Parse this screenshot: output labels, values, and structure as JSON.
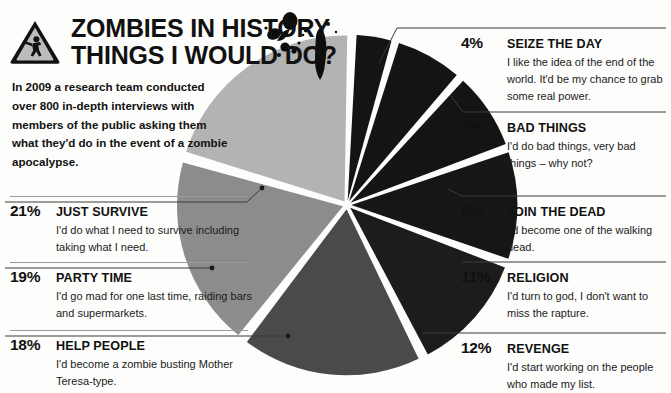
{
  "header": {
    "icon": "zombie-warning-triangle-icon",
    "title_line1": "ZOMBIES IN HISTORY",
    "title_line2": "THINGS I WOULD DO?",
    "splatter_icon": "ink-splatter-decoration"
  },
  "intro": {
    "text": "In 2009 a research team conducted over 800 in-depth interviews with members of the public asking them what they'd do in the event of a zombie apocalypse."
  },
  "colors": {
    "slice_seize_the_day": "#141414",
    "slice_bad_things": "#141414",
    "slice_join_the_dead": "#141414",
    "slice_religion": "#161616",
    "slice_revenge": "#1c1c1c",
    "slice_help_people": "#4a4a4a",
    "slice_party_time": "#8c8c8c",
    "slice_just_survive": "#b3b3b3",
    "background": "#fdfdfb",
    "rule": "#9a9a9a",
    "text": "#111111"
  },
  "chart_data": {
    "type": "pie",
    "categories": [
      "SEIZE THE DAY",
      "BAD THINGS",
      "JOIN THE DEAD",
      "RELIGION",
      "REVENGE",
      "HELP PEOPLE",
      "PARTY TIME",
      "JUST SURVIVE"
    ],
    "values": [
      4,
      7,
      8,
      11,
      12,
      18,
      19,
      21
    ],
    "value_labels": [
      "4%",
      "7%",
      "8%",
      "11%",
      "12%",
      "18%",
      "19%",
      "21%"
    ],
    "unit": "%",
    "exploded": true,
    "legend_position": "both-sides",
    "grid": false
  },
  "left_labels": [
    {
      "pct": "21%",
      "title": "JUST SURVIVE",
      "desc": "I'd do what I need to survive including taking what I need."
    },
    {
      "pct": "19%",
      "title": "PARTY TIME",
      "desc": "I'd go mad for one last time, raiding bars and supermarkets."
    },
    {
      "pct": "18%",
      "title": "HELP PEOPLE",
      "desc": "I'd become a zombie busting Mother Teresa-type."
    }
  ],
  "right_labels": [
    {
      "pct": "4%",
      "title": "SEIZE THE DAY",
      "desc": "I like the idea of the end of the world. It'd be my chance to grab some real power."
    },
    {
      "pct": "7%",
      "title": "BAD THINGS",
      "desc": "I'd do bad things, very bad things – why not?"
    },
    {
      "pct": "8%",
      "title": "JOIN THE DEAD",
      "desc": "I'd become one of the walking dead."
    },
    {
      "pct": "11%",
      "title": "RELIGION",
      "desc": "I'd turn to god, I don't want to miss the rapture."
    },
    {
      "pct": "12%",
      "title": "REVENGE",
      "desc": "I'd start working on the people who made my list."
    }
  ]
}
